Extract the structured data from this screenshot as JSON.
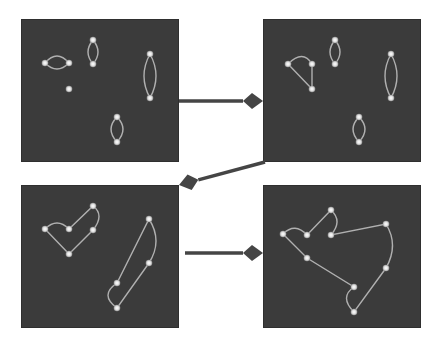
{
  "diagram": {
    "type": "cluster-merge-sequence",
    "colors": {
      "background": "#ffffff",
      "panel": "#3b3b3b",
      "node": "#dedede",
      "edge": "#b0b0b0",
      "arrow": "#454545"
    },
    "panels": [
      {
        "id": "step-1",
        "nodes": [
          [
            24,
            44
          ],
          [
            48,
            44
          ],
          [
            72,
            21
          ],
          [
            72,
            45
          ],
          [
            48,
            70
          ],
          [
            129,
            35
          ],
          [
            129,
            79
          ],
          [
            96,
            98
          ],
          [
            96,
            123
          ]
        ],
        "paths": [
          "M24,44 Q36,30 48,44 Q36,56 24,44 Z",
          "M72,21 Q62,33 72,45 Q82,33 72,21 Z",
          "M129,35 Q117,57 129,79 Q141,57 129,35 Z",
          "M96,98 Q84,110 96,123 Q108,110 96,98 Z"
        ]
      },
      {
        "id": "step-2",
        "nodes": [
          [
            25,
            45
          ],
          [
            49,
            45
          ],
          [
            49,
            70
          ],
          [
            72,
            21
          ],
          [
            72,
            45
          ],
          [
            128,
            35
          ],
          [
            128,
            79
          ],
          [
            96,
            98
          ],
          [
            96,
            123
          ]
        ],
        "paths": [
          "M25,45 Q40,30 49,45 L49,70 Z",
          "M72,21 Q62,33 72,45 Q82,33 72,21 Z",
          "M128,35 Q116,57 128,79 Q140,57 128,35 Z",
          "M96,98 Q84,110 96,123 Q108,110 96,98 Z"
        ]
      },
      {
        "id": "step-3",
        "nodes": [
          [
            24,
            44
          ],
          [
            48,
            44
          ],
          [
            72,
            21
          ],
          [
            72,
            45
          ],
          [
            48,
            69
          ],
          [
            128,
            34
          ],
          [
            128,
            78
          ],
          [
            96,
            98
          ],
          [
            96,
            123
          ]
        ],
        "paths": [
          "M24,44 Q36,32 48,44 L72,21 Q84,30 72,45 L48,69 Z",
          "M128,34 Q142,56 128,78 L96,123 Q78,110 96,98 Z"
        ]
      },
      {
        "id": "step-4",
        "nodes": [
          [
            20,
            49
          ],
          [
            44,
            50
          ],
          [
            68,
            25
          ],
          [
            68,
            50
          ],
          [
            44,
            73
          ],
          [
            123,
            39
          ],
          [
            123,
            83
          ],
          [
            91,
            102
          ],
          [
            91,
            127
          ]
        ],
        "paths": [
          "M20,49 Q32,37 44,50 L68,25 Q80,36 68,50 L123,39 Q136,60 123,83 L91,127 Q76,112 91,102 L44,73 Z"
        ]
      }
    ],
    "arrows": [
      {
        "from": "step-1",
        "to": "step-2",
        "x1": 179,
        "y1": 101,
        "x2": 263,
        "y2": 101
      },
      {
        "from": "step-2",
        "to": "step-3",
        "x1": 265,
        "y1": 162,
        "x2": 179,
        "y2": 185
      },
      {
        "from": "step-3",
        "to": "step-4",
        "x1": 185,
        "y1": 253,
        "x2": 263,
        "y2": 253
      }
    ]
  }
}
